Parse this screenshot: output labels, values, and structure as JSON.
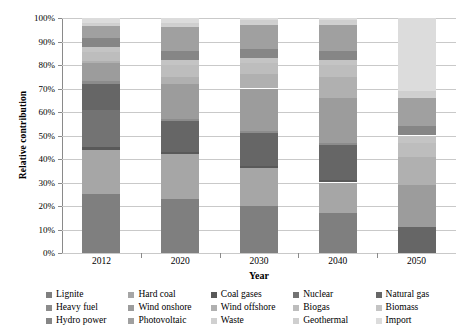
{
  "chart_data": {
    "type": "bar",
    "subtype": "stacked-percentage",
    "title": "",
    "xlabel": "Year",
    "ylabel": "Relative contribution",
    "categories": [
      "2012",
      "2020",
      "2030",
      "2040",
      "2050"
    ],
    "ylim": [
      0,
      100
    ],
    "ytick_labels": [
      "0%",
      "10%",
      "20%",
      "30%",
      "40%",
      "50%",
      "60%",
      "70%",
      "80%",
      "90%",
      "100%"
    ],
    "ytick_values": [
      0,
      10,
      20,
      30,
      40,
      50,
      60,
      70,
      80,
      90,
      100
    ],
    "grid": true,
    "legend_position": "bottom",
    "units": "percent",
    "series": [
      {
        "name": "Lignite",
        "color": "#7f7f7f",
        "values": [
          25.0,
          23.0,
          20.0,
          17.0,
          0.0
        ]
      },
      {
        "name": "Hard coal",
        "color": "#a6a6a6",
        "values": [
          19.0,
          19.0,
          16.0,
          13.0,
          0.0
        ]
      },
      {
        "name": "Coal gases",
        "color": "#595959",
        "values": [
          1.0,
          1.0,
          1.0,
          1.0,
          0.0
        ]
      },
      {
        "name": "Nuclear",
        "color": "#737373",
        "values": [
          16.0,
          0.0,
          0.0,
          0.0,
          0.0
        ]
      },
      {
        "name": "Natural gas",
        "color": "#666666",
        "values": [
          11.0,
          13.0,
          14.0,
          15.0,
          11.0
        ]
      },
      {
        "name": "Heavy fuel",
        "color": "#8c8c8c",
        "values": [
          1.0,
          1.0,
          1.0,
          1.0,
          0.0
        ]
      },
      {
        "name": "Wind onshore",
        "color": "#9c9c9c",
        "values": [
          8.0,
          15.0,
          18.0,
          19.0,
          18.0
        ]
      },
      {
        "name": "Wind offshore",
        "color": "#b0b0b0",
        "values": [
          0.5,
          3.0,
          6.0,
          9.0,
          12.0
        ]
      },
      {
        "name": "Biogas",
        "color": "#bdbdbd",
        "values": [
          4.0,
          5.0,
          5.0,
          5.0,
          6.0
        ]
      },
      {
        "name": "Biomass",
        "color": "#c4c4c4",
        "values": [
          2.0,
          2.0,
          2.0,
          2.0,
          3.0
        ]
      },
      {
        "name": "Hydro power",
        "color": "#868686",
        "values": [
          4.0,
          4.0,
          4.0,
          4.0,
          4.0
        ]
      },
      {
        "name": "Photovoltaic",
        "color": "#a0a0a0",
        "values": [
          5.0,
          10.0,
          10.0,
          11.0,
          12.0
        ]
      },
      {
        "name": "Waste",
        "color": "#d0d0d0",
        "values": [
          1.0,
          1.0,
          1.0,
          1.0,
          1.0
        ]
      },
      {
        "name": "Geothermal",
        "color": "#cfcfcf",
        "values": [
          0.5,
          1.0,
          1.0,
          1.0,
          2.0
        ]
      },
      {
        "name": "Import",
        "color": "#dcdcdc",
        "values": [
          2.0,
          2.0,
          1.0,
          1.0,
          31.0
        ]
      }
    ]
  },
  "legend": {
    "items": [
      {
        "label": "Lignite"
      },
      {
        "label": "Hard coal"
      },
      {
        "label": "Coal gases"
      },
      {
        "label": "Nuclear"
      },
      {
        "label": "Natural gas"
      },
      {
        "label": "Heavy fuel"
      },
      {
        "label": "Wind onshore"
      },
      {
        "label": "Wind offshore"
      },
      {
        "label": "Biogas"
      },
      {
        "label": "Biomass"
      },
      {
        "label": "Hydro power"
      },
      {
        "label": "Photovoltaic"
      },
      {
        "label": "Waste"
      },
      {
        "label": "Geothermal"
      },
      {
        "label": "Import"
      }
    ]
  },
  "axes": {
    "y_title": "Relative contribution",
    "x_title": "Year"
  }
}
